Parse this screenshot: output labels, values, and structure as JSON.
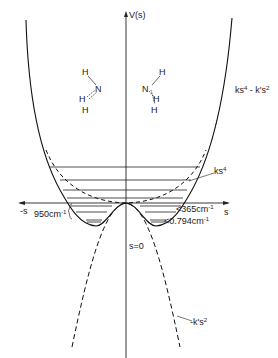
{
  "diagram": {
    "axes": {
      "y_label": "V(s)",
      "x_label_pos": "s",
      "x_label_neg": "-s",
      "origin_label": "s=0"
    },
    "curves": [
      {
        "name": "double-well",
        "label_main": "ks",
        "label_sup1": "4",
        "label_mid": " - k's",
        "label_sup2": "2",
        "style": "solid"
      },
      {
        "name": "quartic",
        "label_main": "ks",
        "label_sup1": "4",
        "style": "dashed"
      },
      {
        "name": "inverted-parabola",
        "label_main": "-k's",
        "label_sup1": "2",
        "style": "dashed"
      }
    ],
    "annotations": {
      "barrier": {
        "value": "950cm",
        "sup": "-1"
      },
      "level_upper": {
        "value": "<365cm",
        "sup": "-1"
      },
      "level_lower": {
        "value": "<0.794cm",
        "sup": "-1"
      }
    },
    "molecules": {
      "left": {
        "atoms": [
          "H",
          "N",
          "H",
          "H"
        ]
      },
      "right": {
        "atoms": [
          "H",
          "N",
          "H",
          "H"
        ]
      }
    },
    "energy_levels_y": [
      167,
      180,
      190,
      198,
      206,
      212,
      221
    ]
  }
}
